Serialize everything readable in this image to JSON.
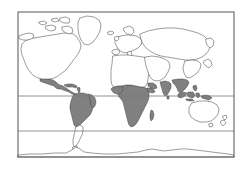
{
  "figure": {
    "name": "world-distribution-map",
    "projection": "equirectangular",
    "frame": {
      "x": 18,
      "y": 12,
      "width": 216,
      "height": 145,
      "stroke": "#555555",
      "stroke_width": 1
    },
    "background_color": "#ffffff",
    "land_fill": "#ffffff",
    "land_stroke": "#3a3a3a",
    "highlight_fill": "#808080",
    "highlight_stroke": "#3a3a3a",
    "graticule_color": "#777777"
  },
  "latitude_lines": [
    {
      "name": "tropic-of-cancer",
      "y": 96,
      "label": ""
    },
    {
      "name": "tropic-of-capricorn",
      "y": 131,
      "label": ""
    }
  ],
  "legend": {
    "visible": false,
    "items": []
  },
  "labels": {
    "visible": false,
    "items": []
  },
  "chart_data": {
    "type": "map",
    "title": "",
    "subtitle": "",
    "xlabel": "",
    "ylabel": "",
    "grid": true,
    "legend_position": "none",
    "xlim": [
      -180,
      180
    ],
    "ylim": [
      -90,
      90
    ],
    "annotations": [],
    "shaded_regions": [
      "Mexico and Central America",
      "Caribbean islands",
      "Northern and central South America",
      "Sub-Saharan Africa",
      "Madagascar",
      "Arabian Peninsula south",
      "Indian subcontinent",
      "Southeast Asia",
      "Indonesia and New Guinea",
      "Southern China"
    ],
    "unshaded_regions": [
      "North America",
      "Greenland",
      "Europe",
      "North Africa",
      "Northern and central Asia",
      "Southern South America",
      "Australia",
      "New Zealand",
      "Antarctica"
    ],
    "series": [
      {
        "name": "tropical-distribution",
        "color": "#808080",
        "values": []
      },
      {
        "name": "absent",
        "color": "#ffffff",
        "values": []
      }
    ]
  }
}
